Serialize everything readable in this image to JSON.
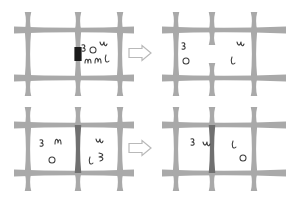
{
  "figure": {
    "background_color": "#ffffff",
    "beam_color": "#a9a9a9",
    "beam_dark_color": "#707070",
    "gate_closed_color": "#1a1a1a",
    "mark_color": "#3a3a3a",
    "arrow_fill": "#ffffff",
    "arrow_stroke": "#b9b9b9",
    "panel_count": 4,
    "arrow_count": 2
  },
  "panels": [
    {
      "id": "top-left",
      "label": "Top left lattice — closed black gate, particles confined right",
      "position": "before",
      "row": "top",
      "gate_state": "closed-black",
      "gate_label": "closed gate",
      "columns": 3,
      "left_cell_marks": 0,
      "right_cell_marks": 5,
      "marks": [
        {
          "name": "mark-tl-1",
          "x": 82,
          "y": 45,
          "d": "M 0 0 c 3 -1 4 2 1 3 c 3 0 3 4 -1 3"
        },
        {
          "name": "mark-tl-2",
          "x": 91,
          "y": 47,
          "d": "M 2 0 c -4 0 -4 6 0 6 c 4 0 4 -6 0 -6"
        },
        {
          "name": "mark-tl-3",
          "x": 100,
          "y": 42,
          "d": "M 0 0 c 1 4 3 4 4 0 c 0 4 2 5 3 2"
        },
        {
          "name": "mark-tl-4",
          "x": 85,
          "y": 59,
          "d": "M 0 4 c 0 -5 3 -5 3 0 c 0 -5 3 -5 3 0"
        },
        {
          "name": "mark-tl-5",
          "x": 95,
          "y": 58,
          "d": "M 0 5 c 0 -6 3 -6 3 -1 c 1 -5 3 -4 3 1"
        },
        {
          "name": "mark-tl-6",
          "x": 105,
          "y": 55,
          "d": "M 1 0 c -2 5 0 9 3 6"
        }
      ]
    },
    {
      "id": "top-right",
      "label": "Top right lattice — gate open (gap), particles distributed both sides",
      "position": "after",
      "row": "top",
      "gate_state": "open-gap",
      "gate_label": "open gap",
      "columns": 3,
      "left_cell_marks": 2,
      "right_cell_marks": 2,
      "marks": [
        {
          "name": "mark-tr-1",
          "x": 182,
          "y": 43,
          "d": "M 0 0 c 3 -1 4 2 1 3 c 3 0 3 4 -1 3"
        },
        {
          "name": "mark-tr-2",
          "x": 184,
          "y": 58,
          "d": "M 2 0 c -4 0 -4 6 0 6 c 4 0 4 -6 0 -6"
        },
        {
          "name": "mark-tr-3",
          "x": 237,
          "y": 42,
          "d": "M 0 0 c 1 4 3 4 4 0 c 0 4 2 5 3 2"
        },
        {
          "name": "mark-tr-4",
          "x": 231,
          "y": 57,
          "d": "M 1 0 c -2 5 0 9 3 6"
        }
      ]
    },
    {
      "id": "bottom-left",
      "label": "Bottom left lattice — dark gate column, particles on both sides",
      "position": "before",
      "row": "bottom",
      "gate_state": "dark-column",
      "gate_label": "dark gate column",
      "columns": 3,
      "left_cell_marks": 3,
      "right_cell_marks": 3,
      "marks": [
        {
          "name": "mark-bl-1",
          "x": 40,
          "y": 140,
          "d": "M 0 0 c 3 -1 4 2 1 3 c 3 0 3 4 -1 3"
        },
        {
          "name": "mark-bl-2",
          "x": 55,
          "y": 139,
          "d": "M 0 5 c 0 -6 3 -6 3 -1 c 1 -5 3 -4 3 1"
        },
        {
          "name": "mark-bl-3",
          "x": 50,
          "y": 157,
          "d": "M 2 0 c -4 0 -4 6 0 6 c 4 0 4 -6 0 -6"
        },
        {
          "name": "mark-bl-4",
          "x": 96,
          "y": 139,
          "d": "M 0 0 c 1 4 3 4 4 0 c 0 4 2 5 3 2"
        },
        {
          "name": "mark-bl-5",
          "x": 89,
          "y": 157,
          "d": "M 1 0 c -2 5 0 9 3 6"
        },
        {
          "name": "mark-bl-6",
          "x": 99,
          "y": 153,
          "d": "M 0 0 c 5 1 5 3 0 4 c 5 0 5 3 1 4"
        }
      ]
    },
    {
      "id": "bottom-right",
      "label": "Bottom right lattice — dark gate column, particles redistributed",
      "position": "after",
      "row": "bottom",
      "gate_state": "dark-column",
      "gate_label": "dark gate column",
      "columns": 3,
      "left_cell_marks": 2,
      "right_cell_marks": 2,
      "marks": [
        {
          "name": "mark-br-1",
          "x": 191,
          "y": 139,
          "d": "M 0 0 c 3 -1 4 2 1 3 c 3 0 3 4 -1 3"
        },
        {
          "name": "mark-br-2",
          "x": 203,
          "y": 142,
          "d": "M 0 0 c 1 4 3 4 4 0 c 0 4 2 5 3 2"
        },
        {
          "name": "mark-br-3",
          "x": 232,
          "y": 141,
          "d": "M 1 0 c -2 5 0 9 3 6"
        },
        {
          "name": "mark-br-4",
          "x": 241,
          "y": 155,
          "d": "M 2 0 c -4 0 -4 6 0 6 c 4 0 4 -6 0 -6"
        }
      ]
    }
  ],
  "arrows": [
    {
      "id": "arrow-top",
      "name": "transition-arrow-top",
      "direction": "right",
      "x": 129,
      "y": 53
    },
    {
      "id": "arrow-bottom",
      "name": "transition-arrow-bottom",
      "direction": "right",
      "x": 129,
      "y": 148
    }
  ]
}
